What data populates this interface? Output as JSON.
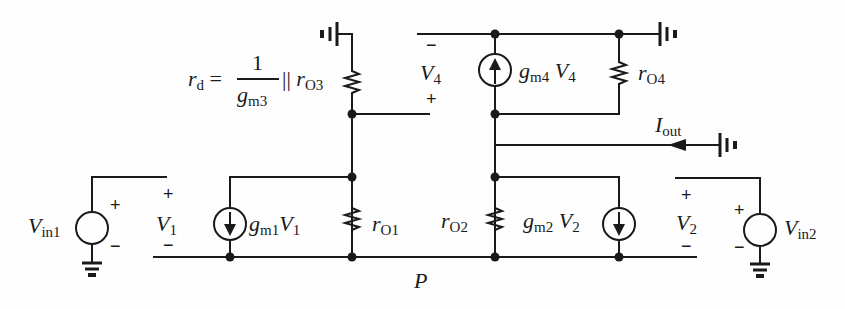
{
  "diagram": {
    "stroke_color": "#1a1a1a",
    "background": "#fefefe",
    "labels": {
      "rd_lhs": "r",
      "rd_lhs_sub": "d",
      "equals": "=",
      "frac_num": "1",
      "frac_den": "g",
      "frac_den_sub": "m3",
      "parallel": "||",
      "rO3": "r",
      "rO3_sub": "O3",
      "V4": "V",
      "V4_sub": "4",
      "V4_minus": "−",
      "V4_plus": "+",
      "gm4V4_g": "g",
      "gm4V4_sub": "m4",
      "gm4V4_V": "V",
      "gm4V4_Vsub": "4",
      "rO4": "r",
      "rO4_sub": "O4",
      "Iout": "I",
      "Iout_sub": "out",
      "Vin1": "V",
      "Vin1_sub": "in1",
      "Vin1_plus": "+",
      "Vin1_minus": "−",
      "V1": "V",
      "V1_sub": "1",
      "V1_plus": "+",
      "V1_minus": "−",
      "gm1V1_g": "g",
      "gm1V1_sub": "m1",
      "gm1V1_V": "V",
      "gm1V1_Vsub": "1",
      "rO1": "r",
      "rO1_sub": "O1",
      "rO2": "r",
      "rO2_sub": "O2",
      "gm2V2_g": "g",
      "gm2V2_sub": "m2",
      "gm2V2_V": "V",
      "gm2V2_Vsub": "2",
      "V2": "V",
      "V2_sub": "2",
      "V2_plus": "+",
      "V2_minus": "−",
      "Vin2": "V",
      "Vin2_sub": "in2",
      "Vin2_plus": "+",
      "Vin2_minus": "−",
      "P": "P"
    },
    "components": [
      {
        "id": "rO3",
        "type": "resistor"
      },
      {
        "id": "rO4",
        "type": "resistor"
      },
      {
        "id": "rO1",
        "type": "resistor"
      },
      {
        "id": "rO2",
        "type": "resistor"
      },
      {
        "id": "gm4V4",
        "type": "current-source",
        "direction": "up"
      },
      {
        "id": "gm1V1",
        "type": "current-source",
        "direction": "down"
      },
      {
        "id": "gm2V2",
        "type": "current-source",
        "direction": "down"
      },
      {
        "id": "Vin1",
        "type": "voltage-source"
      },
      {
        "id": "Vin2",
        "type": "voltage-source"
      }
    ]
  }
}
